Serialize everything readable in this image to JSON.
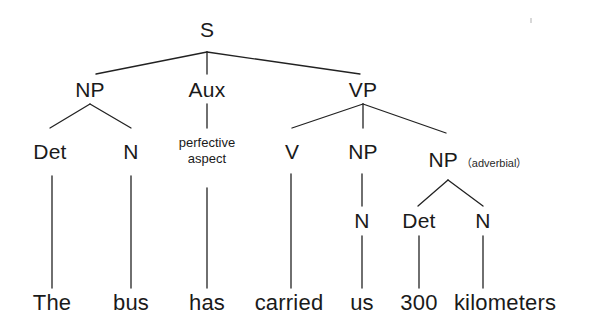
{
  "diagram": {
    "type": "syntax-tree",
    "sentence": "The bus has carried us 300 kilometers",
    "line_color": "#222222",
    "text_color": "#1a1a1a",
    "background": "#ffffff",
    "nodes": {
      "s": "S",
      "np_subject": "NP",
      "aux": "Aux",
      "vp": "VP",
      "det_subject": "Det",
      "n_subject": "N",
      "aux_gloss_line1": "perfective",
      "aux_gloss_line2": "aspect",
      "v": "V",
      "np_object": "NP",
      "np_adverbial": "NP",
      "np_adverbial_note": "（adverbial）",
      "n_object": "N",
      "det_adverbial": "Det",
      "n_adverbial": "N"
    },
    "words": {
      "the": "The",
      "bus": "bus",
      "has": "has",
      "carried": "carried",
      "us": "us",
      "three_hundred": "300",
      "kilometers": "kilometers"
    }
  }
}
